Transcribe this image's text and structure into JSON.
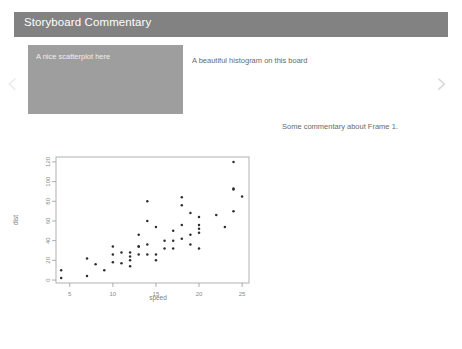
{
  "header": {
    "title": "Storyboard Commentary",
    "bg_color": "#828282",
    "text_color": "#ffffff"
  },
  "carousel": {
    "prev_icon": "‹",
    "next_icon": "›",
    "prev_name": "previous-slide",
    "next_name": "next-slide"
  },
  "slide": {
    "card_caption": "A nice scatterplot here",
    "card_color": "#9e9e9e",
    "side_caption": "A beautiful histogram on this board",
    "commentary": "Some commentary about Frame 1."
  },
  "chart_data": {
    "type": "scatter",
    "title": "",
    "xlabel": "speed",
    "ylabel": "dist",
    "xlim": [
      3.4,
      25.8
    ],
    "ylim": [
      -3,
      125
    ],
    "xticks": [
      5,
      10,
      15,
      20,
      25
    ],
    "yticks": [
      0,
      20,
      40,
      60,
      80,
      100,
      120
    ],
    "grid": false,
    "legend": "none",
    "point_color": "#2f2f2f",
    "x": [
      4,
      4,
      7,
      7,
      8,
      9,
      10,
      10,
      10,
      11,
      11,
      12,
      12,
      12,
      12,
      13,
      13,
      13,
      13,
      14,
      14,
      14,
      14,
      15,
      15,
      15,
      16,
      16,
      17,
      17,
      17,
      18,
      18,
      18,
      18,
      19,
      19,
      19,
      20,
      20,
      20,
      20,
      20,
      22,
      23,
      24,
      24,
      24,
      24,
      25
    ],
    "y": [
      2,
      10,
      4,
      22,
      16,
      10,
      18,
      26,
      34,
      17,
      28,
      14,
      20,
      24,
      28,
      26,
      34,
      34,
      46,
      26,
      36,
      60,
      80,
      20,
      26,
      54,
      32,
      40,
      32,
      40,
      50,
      42,
      56,
      76,
      84,
      36,
      46,
      68,
      32,
      48,
      52,
      56,
      64,
      66,
      54,
      70,
      92,
      93,
      120,
      85
    ],
    "n_points": 50
  }
}
